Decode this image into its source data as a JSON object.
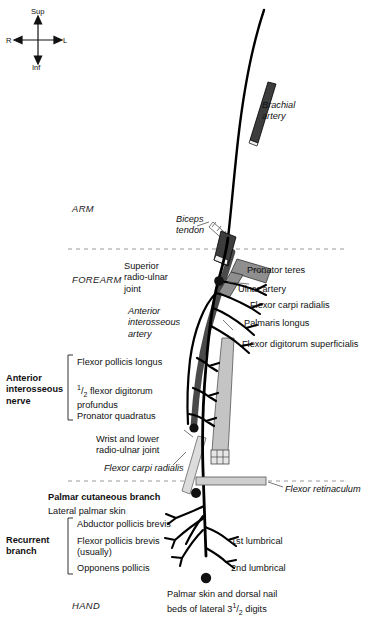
{
  "figure": {
    "colors": {
      "nerve": "#000000",
      "artery": "#4a4a4a",
      "muscle": "#a8a8a8",
      "retinaculum": "#c9c9c9",
      "divider": "#9a9a9a",
      "text": "#111111"
    }
  },
  "compass": {
    "superior": "Sup",
    "inferior": "Inf",
    "right": "R",
    "left": "L"
  },
  "regions": [
    {
      "name": "ARM"
    },
    {
      "name": "FOREARM"
    },
    {
      "name": "HAND"
    }
  ],
  "structures": {
    "brachial_artery": "Brachial\nartery",
    "biceps_tendon": "Biceps\ntendon",
    "pronator_teres": "Pronator teres",
    "ulnar_artery": "Ulnar artery",
    "superior_radio_ulnar_joint": "Superior\nradio-ulnar\njoint",
    "anterior_interosseous_artery": "Anterior\ninterosseous\nartery",
    "wrist_joint": "Wrist and lower\nradio-ulnar joint",
    "flexor_carpi_radialis_italic": "Flexor carpi radialis",
    "flexor_retinaculum": "Flexor retinaculum"
  },
  "branches_right": [
    {
      "label": "Flexor carpi radialis"
    },
    {
      "label": "Palmaris longus"
    },
    {
      "label": "Flexor digitorum superficialis"
    }
  ],
  "anterior_interosseous": {
    "title": "Anterior\ninterosseous\nnerve",
    "items": [
      {
        "label": "Flexor pollicis longus"
      },
      {
        "label": "1/2 flexor digitorum\nprofundus",
        "fraction": true,
        "num": "1",
        "den": "2",
        "rest": " flexor digitorum\nprofundus"
      },
      {
        "label": "Pronator quadratus"
      }
    ]
  },
  "palmar_cutaneous": {
    "title": "Palmar cutaneous branch",
    "target": "Lateral palmar skin"
  },
  "recurrent": {
    "title": "Recurrent\nbranch",
    "items": [
      {
        "label": "Abductor pollicis brevis"
      },
      {
        "label": "Flexor pollicis brevis\n(usually)"
      },
      {
        "label": "Opponens pollicis"
      }
    ]
  },
  "lumbricals": [
    {
      "label": "1st lumbrical"
    },
    {
      "label": "2nd lumbrical"
    }
  ],
  "terminal": {
    "line1": "Palmar skin and dorsal nail",
    "line2a": "beds of lateral 3",
    "num": "1",
    "den": "2",
    "line2b": " digits"
  }
}
